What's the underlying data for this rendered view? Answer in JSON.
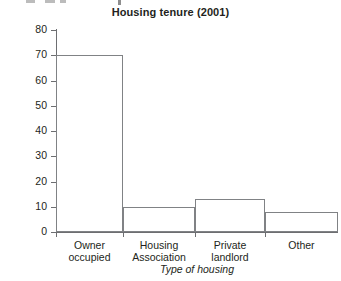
{
  "figure": {
    "title": "Housing tenure (2001)",
    "cutoff_artifact": true
  },
  "chart_data": {
    "type": "bar",
    "title": "Housing tenure (2001)",
    "categories": [
      "Owner occupied",
      "Housing Association",
      "Private landlord",
      "Other"
    ],
    "category_lines": [
      [
        "Owner",
        "occupied"
      ],
      [
        "Housing",
        "Association"
      ],
      [
        "Private",
        "landlord"
      ],
      [
        "Other",
        ""
      ]
    ],
    "values": [
      70,
      10,
      13,
      8
    ],
    "xlabel": "Type of housing",
    "ylabel": "% in each type",
    "ylim": [
      0,
      80
    ],
    "ytick_values": [
      0,
      10,
      20,
      30,
      40,
      50,
      60,
      70,
      80
    ],
    "ytick_labels": [
      "0",
      "10",
      "20",
      "30",
      "40",
      "50",
      "60",
      "70",
      "80"
    ],
    "grid": false,
    "legend": null,
    "bar_fill": "#ffffff",
    "bar_stroke": "#808285",
    "axis_color": "#6d6e71",
    "text_color": "#231f20"
  }
}
